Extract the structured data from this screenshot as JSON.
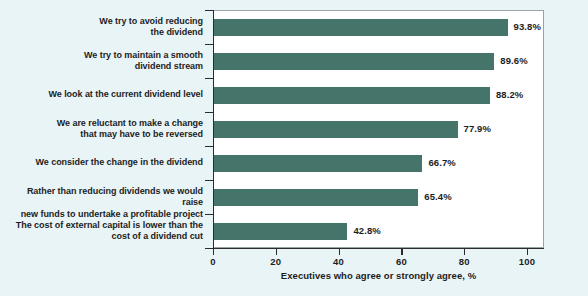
{
  "chart_data": {
    "type": "bar",
    "orientation": "horizontal",
    "title": "",
    "xlabel": "Executives who agree or strongly agree, %",
    "ylabel": "",
    "xlim": [
      0,
      100
    ],
    "xticks": [
      0,
      20,
      40,
      60,
      80,
      100
    ],
    "grid": false,
    "legend": null,
    "bar_color": "#45756a",
    "categories": [
      "We try to avoid reducing\nthe dividend",
      "We try to maintain a smooth\ndividend stream",
      "We look at the current dividend level",
      "We are reluctant to make a change\nthat may have to be reversed",
      "We consider the change in the dividend",
      "Rather than reducing dividends we would raise\nnew funds to undertake a profitable project",
      "The cost of external capital is lower than the\ncost of a dividend cut"
    ],
    "values": [
      93.8,
      89.6,
      88.2,
      77.9,
      66.7,
      65.4,
      42.8
    ],
    "value_labels": [
      "93.8%",
      "89.6%",
      "88.2%",
      "77.9%",
      "66.7%",
      "65.4%",
      "42.8%"
    ],
    "items": [
      {
        "label_lines": [
          "We try to avoid reducing",
          "the dividend"
        ],
        "value": 93.8,
        "value_label": "93.8%"
      },
      {
        "label_lines": [
          "We try to maintain a smooth",
          "dividend stream"
        ],
        "value": 89.6,
        "value_label": "89.6%"
      },
      {
        "label_lines": [
          "We look at the current dividend level"
        ],
        "value": 88.2,
        "value_label": "88.2%"
      },
      {
        "label_lines": [
          "We are reluctant to make a change",
          "that may have to be reversed"
        ],
        "value": 77.9,
        "value_label": "77.9%"
      },
      {
        "label_lines": [
          "We consider the change in the dividend"
        ],
        "value": 66.7,
        "value_label": "66.7%"
      },
      {
        "label_lines": [
          "Rather than reducing dividends we would raise",
          "new funds to undertake a profitable project"
        ],
        "value": 65.4,
        "value_label": "65.4%"
      },
      {
        "label_lines": [
          "The cost of external capital is lower than the",
          "cost of a dividend cut"
        ],
        "value": 42.8,
        "value_label": "42.8%"
      }
    ],
    "tick_labels": [
      "0",
      "20",
      "40",
      "60",
      "80",
      "100"
    ]
  },
  "colors": {
    "background": "#e9f4f7",
    "plot_background": "#ffffff",
    "bar": "#45756a",
    "axis": "#2b2b2b",
    "frame": "#9aa3a6",
    "text": "#1d1d1d"
  }
}
